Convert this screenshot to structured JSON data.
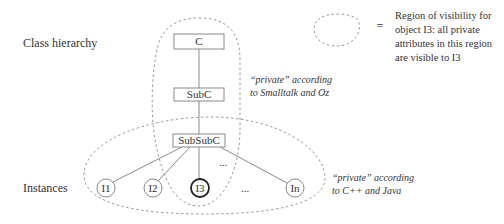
{
  "row_labels": {
    "class_hierarchy": "Class hierarchy",
    "instances": "Instances"
  },
  "classes": [
    {
      "id": "C",
      "label": "C"
    },
    {
      "id": "SubC",
      "label": "SubC"
    },
    {
      "id": "SubSubC",
      "label": "SubSubC"
    }
  ],
  "instances": [
    {
      "id": "I1",
      "label": "I1",
      "highlighted": false
    },
    {
      "id": "I2",
      "label": "I2",
      "highlighted": false
    },
    {
      "id": "I3",
      "label": "I3",
      "highlighted": true
    },
    {
      "id": "In",
      "label": "In",
      "highlighted": false
    }
  ],
  "ellipsis": "...",
  "annotations": {
    "smalltalk_line1": "“private” according",
    "smalltalk_line2": "to Smalltalk and Oz",
    "cpp_line1": "“private” according",
    "cpp_line2": "to C++ and Java"
  },
  "legend": {
    "symbol": "=",
    "lines": [
      "Region of visibility for",
      "object I3: all private",
      "attributes in this region",
      "are visible to I3"
    ]
  }
}
